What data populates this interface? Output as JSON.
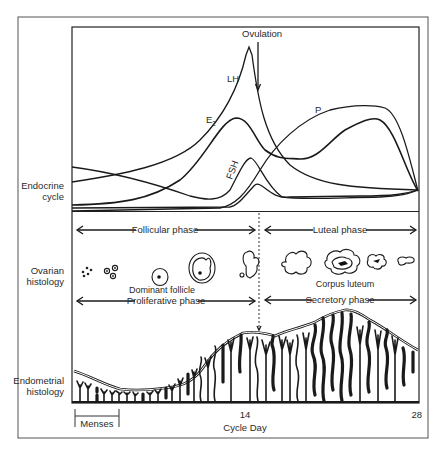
{
  "diagram": {
    "row_labels": {
      "endocrine": [
        "Endocrine",
        "cycle"
      ],
      "ovarian": [
        "Ovarian",
        "histology"
      ],
      "endometrial": [
        "Endometrial",
        "histology"
      ]
    },
    "hormones": {
      "lh": "LH",
      "e2": "E",
      "e2_sub": "2",
      "fsh": "FSH",
      "p": "P"
    },
    "event": {
      "ovulation": "Ovulation"
    },
    "phases": {
      "ovarian_left": "Follicular phase",
      "ovarian_right": "Luteal phase",
      "endometrial_left": "Proliferative phase",
      "endometrial_right": "Secretory phase"
    },
    "structures": {
      "dominant_follicle": "Dominant follicle",
      "corpus_luteum": "Corpus luteum"
    },
    "axis": {
      "tick_mid": "14",
      "tick_end": "28",
      "xlabel": "Cycle Day",
      "menses": "Menses"
    }
  }
}
